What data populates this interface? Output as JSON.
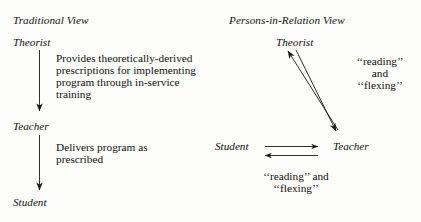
{
  "figure": {
    "left_panel": {
      "heading": "Traditional View",
      "nodes": {
        "top": "Theorist",
        "middle": "Teacher",
        "bottom": "Student"
      },
      "edge_labels": {
        "theorist_to_teacher": "Provides theoretically-derived\nprescriptions for implementing\nprogram through in-service\ntraining",
        "teacher_to_student": "Delivers program as\nprescribed"
      }
    },
    "right_panel": {
      "heading": "Persons-in-Relation View",
      "nodes": {
        "top": "Theorist",
        "left": "Student",
        "right": "Teacher"
      },
      "edge_labels": {
        "theorist_teacher_line1": "‘‘reading’’",
        "theorist_teacher_line2": "and",
        "theorist_teacher_line3": "‘‘flexing’’",
        "student_teacher_line1": "‘‘reading’’ and",
        "student_teacher_line2": "‘‘flexing’’"
      }
    },
    "colors": {
      "ink": "#111111",
      "background": "#fdfdfc"
    }
  }
}
